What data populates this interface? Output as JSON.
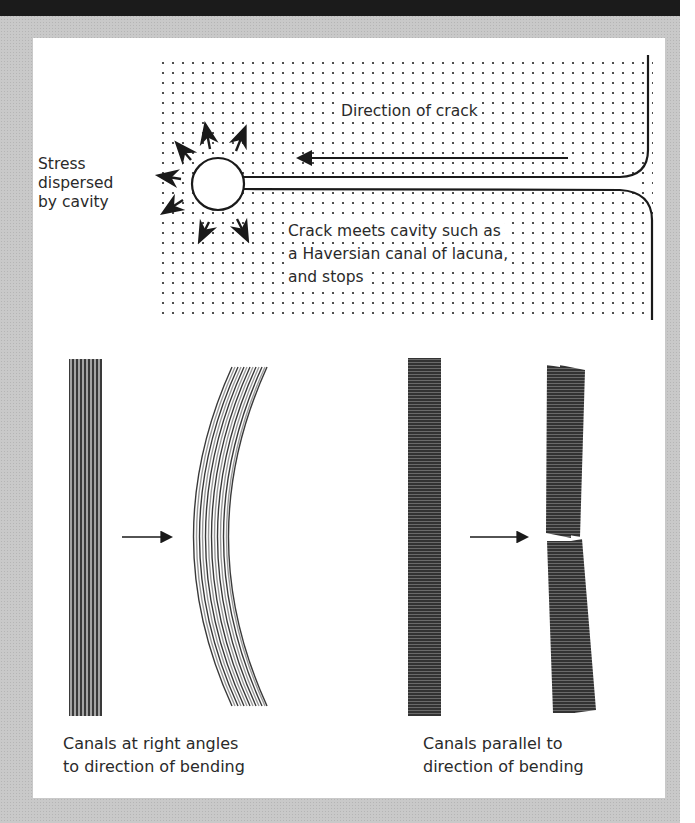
{
  "figure": {
    "top_panel": {
      "labels": {
        "direction_of_crack": "Direction of crack",
        "stress_line1": "Stress",
        "stress_line2": "dispersed",
        "stress_line3": "by cavity",
        "crack_meets_line1": "Crack meets cavity such as",
        "crack_meets_line2": "a Haversian canal of lacuna,",
        "crack_meets_line3": "and stops"
      }
    },
    "bottom_left": {
      "caption_line1": "Canals at right angles",
      "caption_line2": "to direction of bending"
    },
    "bottom_right": {
      "caption_line1": "Canals parallel to",
      "caption_line2": "direction of bending"
    },
    "colors": {
      "frame": "#c9c9c9",
      "top_band": "#1b1b1b",
      "panel": "#ffffff",
      "ink": "#1a1a1a",
      "stripe_light": "#9a9a9a",
      "bar_dark": "#3a3a3a"
    }
  }
}
